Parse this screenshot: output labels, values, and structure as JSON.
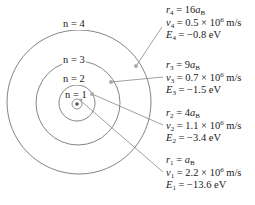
{
  "diagram": {
    "colors": {
      "orbit": "#777777",
      "leader": "#888888",
      "marker": "#aaaaaa",
      "nucleus": "#555555",
      "text": "#222222"
    },
    "nucleus": {
      "cx": 77,
      "cy": 104
    },
    "orbits": [
      {
        "n": 1,
        "label": "n = 1",
        "radius": 17
      },
      {
        "n": 2,
        "label": "n = 2",
        "radius": 39
      },
      {
        "n": 3,
        "label": "n = 3",
        "radius": 55
      },
      {
        "n": 4,
        "label": "n = 4",
        "radius": 72
      }
    ],
    "levels": [
      {
        "n": 4,
        "r_sym": "r",
        "r_sub": "4",
        "r_val": "16",
        "r_unit": "a",
        "r_unit_sub": "B",
        "v_sym": "v",
        "v_sub": "4",
        "v_val": "0.5 × 10",
        "v_exp": "6",
        "v_unit": " m/s",
        "E_sym": "E",
        "E_sub": "4",
        "E_val": "−0.8 eV"
      },
      {
        "n": 3,
        "r_sym": "r",
        "r_sub": "3",
        "r_val": "9",
        "r_unit": "a",
        "r_unit_sub": "B",
        "v_sym": "v",
        "v_sub": "3",
        "v_val": "0.7 × 10",
        "v_exp": "6",
        "v_unit": " m/s",
        "E_sym": "E",
        "E_sub": "3",
        "E_val": "−1.5 eV"
      },
      {
        "n": 2,
        "r_sym": "r",
        "r_sub": "2",
        "r_val": "4",
        "r_unit": "a",
        "r_unit_sub": "B",
        "v_sym": "v",
        "v_sub": "2",
        "v_val": "1.1 × 10",
        "v_exp": "6",
        "v_unit": " m/s",
        "E_sym": "E",
        "E_sub": "2",
        "E_val": "−3.4 eV"
      },
      {
        "n": 1,
        "r_sym": "r",
        "r_sub": "1",
        "r_val": "",
        "r_unit": "a",
        "r_unit_sub": "B",
        "v_sym": "v",
        "v_sub": "1",
        "v_val": "2.2 × 10",
        "v_exp": "6",
        "v_unit": " m/s",
        "E_sym": "E",
        "E_sub": "1",
        "E_val": "−13.6 eV"
      }
    ],
    "equals": " = "
  }
}
